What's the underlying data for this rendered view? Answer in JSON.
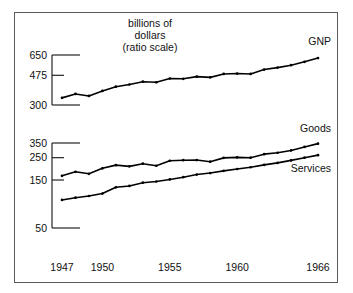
{
  "figure": {
    "title_lines": [
      "billions of",
      "dollars",
      "(ratio scale)"
    ],
    "frame_color": "#5a5a5a",
    "line_color": "#000000",
    "background": "#ffffff"
  },
  "chart_data": {
    "type": "line",
    "subtitle": "",
    "xlabel": "",
    "ylabel": "billions of dollars",
    "scale": "log",
    "grid": false,
    "legend_position": "inline-right-of-series",
    "x": [
      1947,
      1948,
      1949,
      1950,
      1951,
      1952,
      1953,
      1954,
      1955,
      1956,
      1957,
      1958,
      1959,
      1960,
      1961,
      1962,
      1963,
      1964,
      1965,
      1966
    ],
    "x_tick_labels": [
      "1947",
      "1950",
      "1955",
      "1960",
      "1966"
    ],
    "x_ticks": [
      1947,
      1950,
      1955,
      1960,
      1966
    ],
    "panels": [
      {
        "name": "upper",
        "y_ticks": [
          300,
          475,
          650
        ],
        "y_tick_labels": [
          "300",
          "475",
          "650"
        ],
        "ylim": [
          300,
          650
        ],
        "series": [
          {
            "name": "GNP",
            "label": "GNP",
            "values": [
              335,
              356,
              345,
              373,
              398,
              412,
              430,
              426,
              452,
              450,
              465,
              460,
              485,
              488,
              485,
              519,
              535,
              555,
              585,
              620
            ]
          }
        ]
      },
      {
        "name": "lower",
        "y_ticks": [
          50,
          150,
          250,
          350
        ],
        "y_tick_labels": [
          "50",
          "150",
          "250",
          "350"
        ],
        "ylim": [
          50,
          350
        ],
        "series": [
          {
            "name": "Goods",
            "label": "Goods",
            "values": [
              165,
              181,
              173,
              196,
              211,
              205,
              218,
              208,
              233,
              236,
              237,
              228,
              249,
              252,
              250,
              271,
              280,
              295,
              320,
              345
            ]
          },
          {
            "name": "Services",
            "label": "Services",
            "values": [
              95,
              100,
              104,
              110,
              127,
              131,
              141,
              145,
              152,
              160,
              170,
              176,
              185,
              193,
              201,
              212,
              222,
              235,
              250,
              265
            ]
          }
        ]
      }
    ]
  }
}
